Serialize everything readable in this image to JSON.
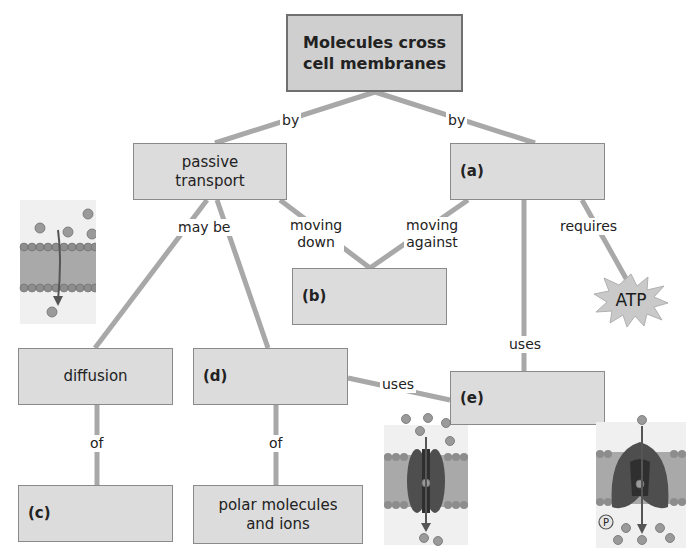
{
  "diagram": {
    "type": "concept-map",
    "colors": {
      "box_fill": "#dcdcdc",
      "box_border": "#8a8a8a",
      "link": "#a8a8a8",
      "text": "#222222"
    },
    "nodes": {
      "root": "Molecules cross cell membranes",
      "root_line1": "Molecules cross",
      "root_line2": "cell membranes",
      "passive_line1": "passive",
      "passive_line2": "transport",
      "a": "(a)",
      "b": "(b)",
      "c": "(c)",
      "d": "(d)",
      "e": "(e)",
      "diffusion": "diffusion",
      "polar_line1": "polar molecules",
      "polar_line2": "and ions",
      "atp": "ATP"
    },
    "links": {
      "by_left": "by",
      "by_right": "by",
      "may_be": "may be",
      "moving_down_1": "moving",
      "moving_down_2": "down",
      "moving_against_1": "moving",
      "moving_against_2": "against",
      "requires": "requires",
      "uses_a_e": "uses",
      "uses_d_e": "uses",
      "of_left": "of",
      "of_right": "of"
    },
    "illustrations": {
      "simple_diffusion": "membrane-diffusion-icon",
      "channel_protein": "channel-protein-icon",
      "pump_protein": "pump-protein-icon",
      "phosphate_label": "P"
    }
  }
}
